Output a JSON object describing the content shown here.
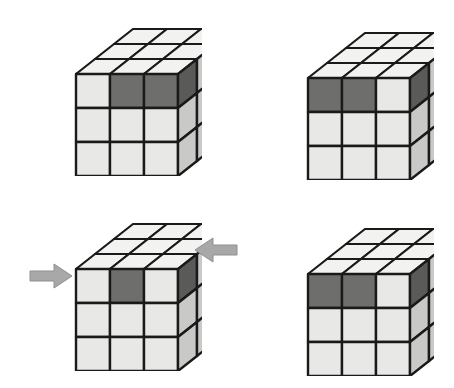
{
  "figure": {
    "background_color": "#ffffff",
    "width": 454,
    "height": 388,
    "palette": {
      "light": "#e8e8e6",
      "light_shaded": "#c9c9c7",
      "dark": "#6e6e6c",
      "dark_shaded": "#5a5a58",
      "top_light": "#f2f2f0",
      "outline": "#1a1a1a",
      "arrow_fill": "#a8a8a8",
      "arrow_outline": "#8f8f8f"
    },
    "panels": [
      {
        "id": "panel-1",
        "position": "top-left",
        "x": 62,
        "y": 26,
        "cube": {
          "label": "cube-step-1",
          "top_face": [
            [
              "light",
              "light",
              "light"
            ],
            [
              "light",
              "light",
              "light"
            ],
            [
              "light",
              "light",
              "light"
            ]
          ],
          "front_face": [
            [
              "light",
              "dark",
              "dark"
            ],
            [
              "light",
              "light",
              "light"
            ],
            [
              "light",
              "light",
              "light"
            ]
          ],
          "right_face": [
            [
              "dark",
              "light",
              "light"
            ],
            [
              "light",
              "light",
              "light"
            ],
            [
              "light",
              "light",
              "light"
            ]
          ]
        },
        "arrows": []
      },
      {
        "id": "panel-2",
        "position": "top-right",
        "x": 294,
        "y": 30,
        "cube": {
          "label": "cube-step-2",
          "top_face": [
            [
              "light",
              "light",
              "light"
            ],
            [
              "light",
              "light",
              "light"
            ],
            [
              "light",
              "light",
              "light"
            ]
          ],
          "front_face": [
            [
              "dark",
              "dark",
              "light"
            ],
            [
              "light",
              "light",
              "light"
            ],
            [
              "light",
              "light",
              "light"
            ]
          ],
          "right_face": [
            [
              "dark",
              "light",
              "light"
            ],
            [
              "light",
              "light",
              "light"
            ],
            [
              "light",
              "light",
              "light"
            ]
          ]
        },
        "arrows": []
      },
      {
        "id": "panel-3",
        "position": "bottom-left",
        "x": 62,
        "y": 221,
        "cube": {
          "label": "cube-step-3",
          "top_face": [
            [
              "light",
              "light",
              "light"
            ],
            [
              "light",
              "light",
              "light"
            ],
            [
              "light",
              "light",
              "light"
            ]
          ],
          "front_face": [
            [
              "light",
              "dark",
              "light"
            ],
            [
              "light",
              "light",
              "light"
            ],
            [
              "light",
              "light",
              "light"
            ]
          ],
          "right_face": [
            [
              "dark",
              "light",
              "light"
            ],
            [
              "light",
              "light",
              "light"
            ],
            [
              "light",
              "light",
              "light"
            ]
          ]
        },
        "arrows": [
          {
            "name": "arrow-left-pointing-right",
            "direction": "right",
            "x": 28,
            "y": 262
          },
          {
            "name": "arrow-right-pointing-left",
            "direction": "left",
            "x": 193,
            "y": 236
          }
        ]
      },
      {
        "id": "panel-4",
        "position": "bottom-right",
        "x": 294,
        "y": 226,
        "cube": {
          "label": "cube-step-4",
          "top_face": [
            [
              "light",
              "light",
              "light"
            ],
            [
              "light",
              "light",
              "light"
            ],
            [
              "light",
              "light",
              "light"
            ]
          ],
          "front_face": [
            [
              "dark",
              "dark",
              "light"
            ],
            [
              "light",
              "light",
              "light"
            ],
            [
              "light",
              "light",
              "light"
            ]
          ],
          "right_face": [
            [
              "dark",
              "light",
              "light"
            ],
            [
              "light",
              "light",
              "light"
            ],
            [
              "light",
              "light",
              "light"
            ]
          ]
        },
        "arrows": []
      }
    ]
  }
}
